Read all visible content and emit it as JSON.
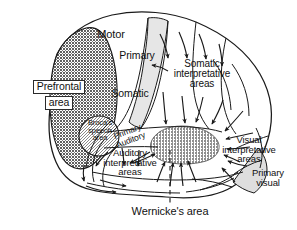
{
  "figure": {
    "caption": "Wernicke's area",
    "background_color": "#ffffff",
    "outline_color": "#1a1a1a"
  },
  "regions": {
    "prefrontal": {
      "label_line1": "Prefrontal",
      "label_line2": "area",
      "fill_color": "#6e6e6e",
      "pattern": "dark-dither"
    },
    "brocas": {
      "label_line1": "Broca's",
      "label_line2": "speech",
      "label_line3": "area",
      "fill_color": "#9a9a9a",
      "pattern": "medium-dither"
    },
    "motor": {
      "label": "Motor",
      "fill_color": "#ffffff"
    },
    "primary_motor": {
      "label": "Primary",
      "fill_color": "#e2e2e2"
    },
    "somatic": {
      "label": "Somatic",
      "fill_color": "#ffffff"
    },
    "somatic_interpretative": {
      "label_line1": "Somatic",
      "label_line2": "interpretative",
      "label_line3": "areas",
      "fill_color": "#ffffff"
    },
    "primary_auditory": {
      "label_line1": "Primary",
      "label_line2": "Auditory",
      "fill_color": "#ffffff"
    },
    "auditory_interpretative": {
      "label_line1": "Auditory",
      "label_line2": "interpretative",
      "label_line3": "areas",
      "fill_color": "#ffffff"
    },
    "wernicke": {
      "label": "Wernicke's area",
      "fill_color": "#8c8c8c",
      "pattern": "medium-dither"
    },
    "visual_interpretative": {
      "label_line1": "Visual",
      "label_line2": "interpretative",
      "label_line3": "areas",
      "fill_color": "#ffffff"
    },
    "primary_visual": {
      "label_line1": "Primary",
      "label_line2": "visual",
      "fill_color": "#dcdcdc"
    }
  },
  "annotations": {
    "dashed_pointer": "dashed-leader-line",
    "arrow_count": 26,
    "arrow_color": "#1a1a1a"
  }
}
